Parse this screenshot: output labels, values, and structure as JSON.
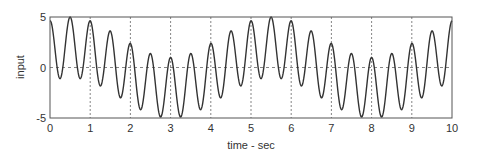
{
  "chart_data": {
    "type": "line",
    "title": "",
    "xlabel": "time - sec",
    "ylabel": "input",
    "xlim": [
      0,
      10
    ],
    "ylim": [
      -5,
      5
    ],
    "xticks": [
      0,
      1,
      2,
      3,
      4,
      5,
      6,
      7,
      8,
      9,
      10
    ],
    "yticks": [
      -5,
      0,
      5
    ],
    "grid": "dashed vertical at integer x, dashed horizontal at y=0",
    "legend": null,
    "series": [
      {
        "name": "input",
        "description": "sum of slow 0.2 Hz sinusoid (amp ~2) and 2 Hz sinusoid (amp ~3), both peaking near t=0.5",
        "formula": "2*cos(2*pi*0.2*(t-0.5)) + 3*cos(2*pi*2*(t-0.5))",
        "x": [
          0,
          0.25,
          0.5,
          0.75,
          1.0,
          1.25,
          1.5,
          1.75,
          2.0,
          2.25,
          2.5,
          2.75,
          3.0,
          3.25,
          3.5,
          3.75,
          4.0,
          4.25,
          4.5,
          4.75,
          5.0,
          5.25,
          5.5,
          5.75,
          6.0,
          6.25,
          6.5,
          6.75,
          7.0,
          7.25,
          7.5,
          7.75,
          8.0,
          8.25,
          8.5,
          8.75,
          9.0,
          9.25,
          9.5,
          9.75,
          10.0
        ],
        "values": [
          4.6,
          -1.05,
          5.0,
          -1.05,
          4.6,
          -1.59,
          3.8,
          -2.32,
          2.7,
          -3.1,
          1.6,
          -3.71,
          1.0,
          -4.98,
          0.4,
          -4.98,
          1.0,
          -4.62,
          1.6,
          -3.91,
          2.4,
          -3.0,
          5.0,
          -1.05,
          4.6,
          -1.59,
          3.8,
          -2.32,
          2.7,
          -3.1,
          1.6,
          -3.71,
          1.0,
          -4.98,
          1.0,
          -4.62,
          1.6,
          -3.91,
          2.4,
          -1.38,
          4.2
        ]
      }
    ],
    "tick_labels": {
      "x": [
        "0",
        "1",
        "2",
        "3",
        "4",
        "5",
        "6",
        "7",
        "8",
        "9",
        "10"
      ],
      "y": [
        "-5",
        "0",
        "5"
      ]
    },
    "colors": {
      "line": "#333333",
      "axes": "#555555",
      "grid": "#666666"
    }
  }
}
